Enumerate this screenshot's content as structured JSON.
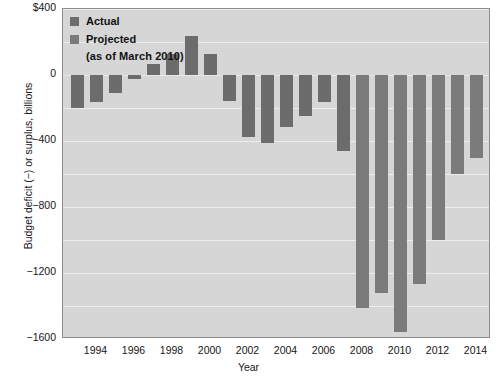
{
  "chart_data": {
    "type": "bar",
    "title": "",
    "xlabel": "Year",
    "ylabel": "Budget deficit (−) or surplus, billions",
    "ylim": [
      -1600,
      400
    ],
    "ytick_labels": [
      "$400",
      "0",
      "−400",
      "−800",
      "−1200",
      "−1600"
    ],
    "ytick_values": [
      400,
      0,
      -400,
      -800,
      -1200,
      -1600
    ],
    "xtick_labels": [
      "1994",
      "1996",
      "1998",
      "2000",
      "2002",
      "2004",
      "2006",
      "2008",
      "2010",
      "2012",
      "2014"
    ],
    "xtick_values": [
      1994,
      1996,
      1998,
      2000,
      2002,
      2004,
      2006,
      2008,
      2010,
      2012,
      2014
    ],
    "grid": true,
    "legend_position": "top-left",
    "legend": [
      {
        "label": "Actual",
        "color": "#6c6c6c"
      },
      {
        "label": "Projected",
        "color": "#7b7b7b"
      }
    ],
    "legend_note": "(as of March 2010)",
    "categories": [
      1993,
      1994,
      1995,
      1996,
      1997,
      1998,
      1999,
      2000,
      2001,
      2002,
      2003,
      2004,
      2005,
      2006,
      2007,
      2008,
      2009,
      2010,
      2011,
      2012,
      2013,
      2014
    ],
    "values": [
      -203,
      -164,
      -107,
      -22,
      69,
      126,
      236,
      128,
      -158,
      -378,
      -413,
      -318,
      -248,
      -161,
      -459,
      -1413,
      -1320,
      -1556,
      -1267,
      -1000,
      -600,
      -500
    ],
    "series": [
      {
        "name": "Actual",
        "points": [
          {
            "year": 1993,
            "value": -203
          },
          {
            "year": 1994,
            "value": -164
          },
          {
            "year": 1995,
            "value": -107
          },
          {
            "year": 1996,
            "value": -22
          },
          {
            "year": 1997,
            "value": 69
          },
          {
            "year": 1998,
            "value": 126
          },
          {
            "year": 1999,
            "value": 236
          },
          {
            "year": 2000,
            "value": 128
          },
          {
            "year": 2001,
            "value": -158
          },
          {
            "year": 2002,
            "value": -378
          },
          {
            "year": 2003,
            "value": -413
          },
          {
            "year": 2004,
            "value": -318
          },
          {
            "year": 2005,
            "value": -248
          },
          {
            "year": 2006,
            "value": -161
          },
          {
            "year": 2007,
            "value": -459
          },
          {
            "year": 2008,
            "value": -1413
          }
        ]
      },
      {
        "name": "Projected",
        "points": [
          {
            "year": 2009,
            "value": -1320
          },
          {
            "year": 2010,
            "value": -1556
          },
          {
            "year": 2011,
            "value": -1267
          },
          {
            "year": 2012,
            "value": -1000
          },
          {
            "year": 2013,
            "value": -600
          },
          {
            "year": 2014,
            "value": -500
          }
        ]
      }
    ],
    "bars": [
      {
        "x": 70,
        "value": -203,
        "kind": "actual"
      },
      {
        "x": 89,
        "value": -164,
        "kind": "actual"
      },
      {
        "x": 108,
        "value": -107,
        "kind": "actual"
      },
      {
        "x": 127,
        "value": -22,
        "kind": "actual"
      },
      {
        "x": 146,
        "value": 69,
        "kind": "actual"
      },
      {
        "x": 165,
        "value": 126,
        "kind": "actual"
      },
      {
        "x": 184,
        "value": 236,
        "kind": "actual"
      },
      {
        "x": 203,
        "value": 128,
        "kind": "actual"
      },
      {
        "x": 222,
        "value": -158,
        "kind": "actual"
      },
      {
        "x": 241,
        "value": -378,
        "kind": "actual"
      },
      {
        "x": 260,
        "value": -413,
        "kind": "actual"
      },
      {
        "x": 279,
        "value": -318,
        "kind": "actual"
      },
      {
        "x": 298,
        "value": -248,
        "kind": "actual"
      },
      {
        "x": 317,
        "value": -161,
        "kind": "actual"
      },
      {
        "x": 336,
        "value": -459,
        "kind": "actual"
      },
      {
        "x": 355,
        "value": -1413,
        "kind": "projected"
      },
      {
        "x": 374,
        "value": -1320,
        "kind": "projected"
      },
      {
        "x": 393,
        "value": -1556,
        "kind": "projected"
      },
      {
        "x": 412,
        "value": -1267,
        "kind": "projected"
      },
      {
        "x": 431,
        "value": -1000,
        "kind": "projected"
      },
      {
        "x": 450,
        "value": -600,
        "kind": "projected"
      },
      {
        "x": 469,
        "value": -500,
        "kind": "projected"
      }
    ]
  },
  "colors": {
    "bar_actual": "#6c6c6c",
    "bar_projected": "#7b7b7b",
    "plot_background": "#d6d6d6",
    "gridline": "#ededed",
    "axis_border": "#8d8d8d",
    "text": "#161616",
    "page_background": "#ffffff"
  }
}
